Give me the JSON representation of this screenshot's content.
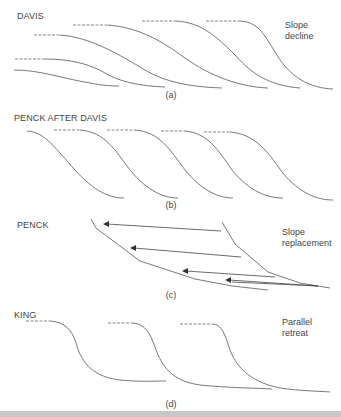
{
  "panels": [
    {
      "id": "a",
      "title": "DAVIS",
      "caption": "(a)",
      "side_label_line1": "Slope",
      "side_label_line2": "decline",
      "concept": "Slope decline — successive slope profiles lower and flatten over time"
    },
    {
      "id": "b",
      "title": "PENCK AFTER DAVIS",
      "caption": "(b)",
      "concept": "Successive slope profiles retreating with similar form"
    },
    {
      "id": "c",
      "title": "PENCK",
      "caption": "(c)",
      "side_label_line1": "Slope",
      "side_label_line2": "replacement",
      "concept": "Slope replacement — steep segments replaced by gentler basal slopes (arrows show retreat direction)"
    },
    {
      "id": "d",
      "title": "KING",
      "caption": "(d)",
      "side_label_line1": "Parallel",
      "side_label_line2": "retreat",
      "concept": "Parallel retreat — slope profile retreats keeping constant angle, extending pediment"
    }
  ],
  "colors": {
    "line": "#555555",
    "text": "#444444",
    "bottom_bar": "#c8c8c8"
  }
}
